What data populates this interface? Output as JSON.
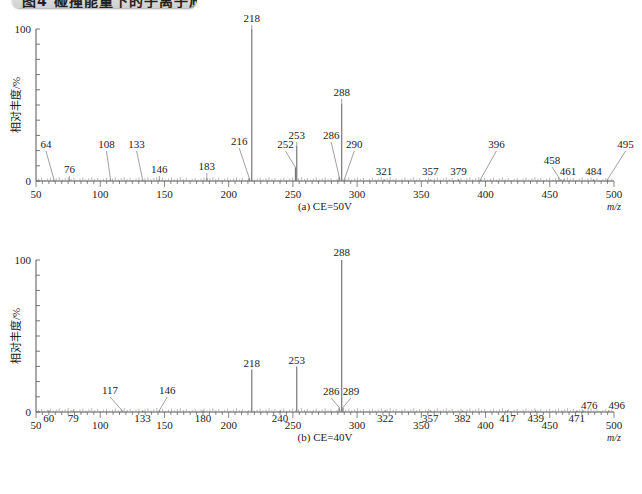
{
  "header": {
    "title": "图4 碰撞能量下的子离子质谱图"
  },
  "chart_data": [
    {
      "type": "bar",
      "subtype": "mass-spectrum",
      "title": "(a) CE=50V",
      "xlabel": "m/z",
      "ylabel": "相对丰度/%",
      "xlim": [
        50,
        500
      ],
      "ylim": [
        0,
        100
      ],
      "x_ticks": [
        50,
        100,
        150,
        200,
        250,
        300,
        350,
        400,
        450,
        500
      ],
      "y_ticks": [
        0,
        100
      ],
      "grid": false,
      "peaks": [
        {
          "mz": 64,
          "intensity": 1,
          "label": "64"
        },
        {
          "mz": 76,
          "intensity": 1,
          "label": "76"
        },
        {
          "mz": 108,
          "intensity": 1,
          "label": "108"
        },
        {
          "mz": 133,
          "intensity": 1,
          "label": "133"
        },
        {
          "mz": 146,
          "intensity": 1,
          "label": "146"
        },
        {
          "mz": 183,
          "intensity": 2,
          "label": "183"
        },
        {
          "mz": 216,
          "intensity": 2,
          "label": "216"
        },
        {
          "mz": 218,
          "intensity": 100,
          "label": "218"
        },
        {
          "mz": 252,
          "intensity": 9,
          "label": "252"
        },
        {
          "mz": 253,
          "intensity": 23,
          "label": "253"
        },
        {
          "mz": 286,
          "intensity": 3,
          "label": "286"
        },
        {
          "mz": 288,
          "intensity": 51,
          "label": "288"
        },
        {
          "mz": 290,
          "intensity": 1,
          "label": "290"
        },
        {
          "mz": 321,
          "intensity": 1,
          "label": "321"
        },
        {
          "mz": 357,
          "intensity": 1,
          "label": "357"
        },
        {
          "mz": 379,
          "intensity": 1,
          "label": "379"
        },
        {
          "mz": 396,
          "intensity": 1,
          "label": "396"
        },
        {
          "mz": 458,
          "intensity": 1,
          "label": "458"
        },
        {
          "mz": 461,
          "intensity": 1,
          "label": "461"
        },
        {
          "mz": 484,
          "intensity": 1,
          "label": "484"
        },
        {
          "mz": 495,
          "intensity": 1,
          "label": "495"
        }
      ]
    },
    {
      "type": "bar",
      "subtype": "mass-spectrum",
      "title": "(b) CE=40V",
      "xlabel": "m/z",
      "ylabel": "相对丰度/%",
      "xlim": [
        50,
        500
      ],
      "ylim": [
        0,
        100
      ],
      "x_ticks": [
        50,
        100,
        150,
        200,
        250,
        300,
        350,
        400,
        450,
        500
      ],
      "y_ticks": [
        0,
        100
      ],
      "grid": false,
      "peaks": [
        {
          "mz": 60,
          "intensity": 1,
          "label": "60"
        },
        {
          "mz": 79,
          "intensity": 1,
          "label": "79"
        },
        {
          "mz": 117,
          "intensity": 1,
          "label": "117"
        },
        {
          "mz": 133,
          "intensity": 1,
          "label": "133"
        },
        {
          "mz": 146,
          "intensity": 1,
          "label": "146"
        },
        {
          "mz": 180,
          "intensity": 1,
          "label": "180"
        },
        {
          "mz": 218,
          "intensity": 28,
          "label": "218"
        },
        {
          "mz": 240,
          "intensity": 1,
          "label": "240"
        },
        {
          "mz": 253,
          "intensity": 30,
          "label": "253"
        },
        {
          "mz": 286,
          "intensity": 3,
          "label": "286"
        },
        {
          "mz": 288,
          "intensity": 100,
          "label": "288"
        },
        {
          "mz": 289,
          "intensity": 3,
          "label": "289"
        },
        {
          "mz": 322,
          "intensity": 1,
          "label": "322"
        },
        {
          "mz": 357,
          "intensity": 1,
          "label": "357"
        },
        {
          "mz": 382,
          "intensity": 1,
          "label": "382"
        },
        {
          "mz": 417,
          "intensity": 1,
          "label": "417"
        },
        {
          "mz": 439,
          "intensity": 1,
          "label": "439"
        },
        {
          "mz": 471,
          "intensity": 1,
          "label": "471"
        },
        {
          "mz": 476,
          "intensity": 1,
          "label": "476"
        },
        {
          "mz": 496,
          "intensity": 1,
          "label": "496"
        }
      ]
    }
  ],
  "charts": {
    "a": {
      "caption": "(a) CE=50V",
      "xunit": "m/z",
      "ylabel": "相对丰度/%",
      "y_top": "100",
      "y_zero": "0",
      "x_ticks": [
        "50",
        "100",
        "150",
        "200",
        "250",
        "300",
        "350",
        "400",
        "450",
        "500"
      ]
    },
    "b": {
      "caption": "(b) CE=40V",
      "xunit": "m/z",
      "ylabel": "相对丰度/%",
      "y_top": "100",
      "y_zero": "0",
      "x_ticks": [
        "50",
        "100",
        "150",
        "200",
        "250",
        "300",
        "350",
        "400",
        "450",
        "500"
      ]
    }
  }
}
